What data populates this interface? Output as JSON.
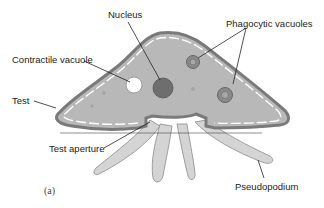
{
  "figure": {
    "panel_label": "(a)",
    "colors": {
      "background": "#ffffff",
      "cytoplasm": "#b8b8b8",
      "test_outline": "#7a7a7a",
      "nucleus": "#6e6e6e",
      "pseudopodium": "#d4d4d4",
      "vacuole_ring": "#7a7a7a",
      "label_text": "#222222",
      "leader_line": "#222222"
    }
  },
  "labels": {
    "nucleus": "Nucleus",
    "contractile_vacuole": "Contractile vacuole",
    "phagocytic_vacuoles": "Phagocytic vacuoles",
    "test": "Test",
    "test_aperture": "Test aperture",
    "pseudopodium": "Pseudopodium"
  }
}
